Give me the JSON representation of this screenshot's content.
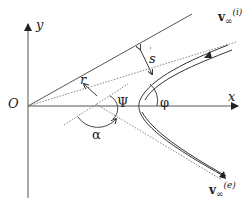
{
  "diagram": {
    "title": "",
    "axes": {
      "origin_label": "O",
      "x_label": "x",
      "y_label": "y"
    },
    "labels": {
      "r": "r",
      "s": "s",
      "psi": "Ψ",
      "phi": "φ",
      "alpha": "α",
      "v_in_main": "v",
      "v_in_sub": "∞",
      "v_in_sup": "(i)",
      "v_out_main": "v",
      "v_out_sub": "∞",
      "v_out_sup": "(e)"
    },
    "colors": {
      "line": "#333333",
      "dotted": "#777777",
      "background": "#ffffff"
    }
  }
}
